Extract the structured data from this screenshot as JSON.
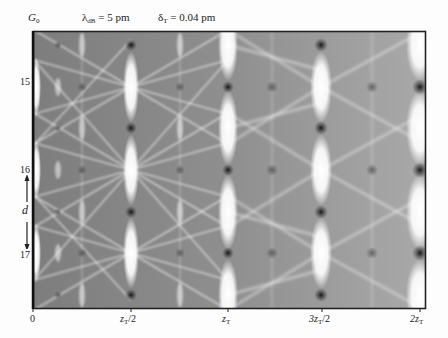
{
  "figure": {
    "title_left": {
      "main": "G",
      "sub": "0"
    },
    "param1": {
      "symbol": "λ",
      "sub": "dB",
      "value": " = 5 pm"
    },
    "param2": {
      "symbol": "δ",
      "sub": "T",
      "value": " = 0.04 pm"
    },
    "y_labels": [
      {
        "text": "15",
        "y": 82
      },
      {
        "text": "16",
        "y": 170
      },
      {
        "text": "17",
        "y": 255
      }
    ],
    "period_label": "d",
    "x_ticks": [
      {
        "main": "0",
        "sub": "",
        "tail": "",
        "x": 33
      },
      {
        "main": "z",
        "sub": "T",
        "tail": "/2",
        "x": 131
      },
      {
        "main": "z",
        "sub": "T",
        "tail": "",
        "x": 228
      },
      {
        "main": "3z",
        "sub": "T",
        "tail": "/2",
        "x": 322
      },
      {
        "main": "2z",
        "sub": "T",
        "tail": "",
        "x": 420
      }
    ]
  },
  "colors": {
    "frame": "#222222",
    "bright": "#ffffff",
    "dark": "#1a1a1a",
    "mid": "#8a8a8a"
  }
}
